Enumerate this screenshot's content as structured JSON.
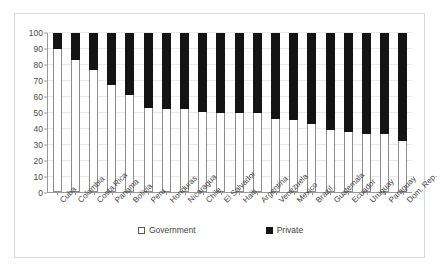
{
  "chart_data": {
    "type": "bar",
    "subtype": "100% stacked column",
    "title": "",
    "xlabel": "",
    "ylabel": "",
    "ylim": [
      0,
      100
    ],
    "ytick_step": 10,
    "yticks": [
      0,
      10,
      20,
      30,
      40,
      50,
      60,
      70,
      80,
      90,
      100
    ],
    "grid": true,
    "legend_position": "bottom",
    "categories": [
      "Cuba",
      "Colombia",
      "Costa Rica",
      "Panama",
      "Bolivia",
      "Peru",
      "Honduras",
      "Nicaragua",
      "Chile",
      "El Salvador",
      "Haiti",
      "Argentina",
      "Venezuela",
      "Mexico",
      "Brazil",
      "Guatemala",
      "Ecuador",
      "Uruguay",
      "Paraguay",
      "Dom. Rep."
    ],
    "series": [
      {
        "name": "Government",
        "color": "#ffffff",
        "values": [
          90,
          83,
          77,
          67.5,
          61,
          53,
          52,
          52,
          50.5,
          50,
          49.5,
          49.5,
          46,
          45,
          43,
          39,
          38,
          36.5,
          36.5,
          32
        ]
      },
      {
        "name": "Private",
        "color": "#141414",
        "values": [
          10,
          17,
          23,
          32.5,
          39,
          47,
          48,
          48,
          49.5,
          50,
          50.5,
          50.5,
          54,
          55,
          57,
          61,
          62,
          63.5,
          63.5,
          68
        ]
      }
    ]
  },
  "legend": {
    "items": [
      {
        "label": "Government",
        "swatch": "legend-swatch-government"
      },
      {
        "label": "Private",
        "swatch": "legend-swatch-private"
      }
    ]
  }
}
